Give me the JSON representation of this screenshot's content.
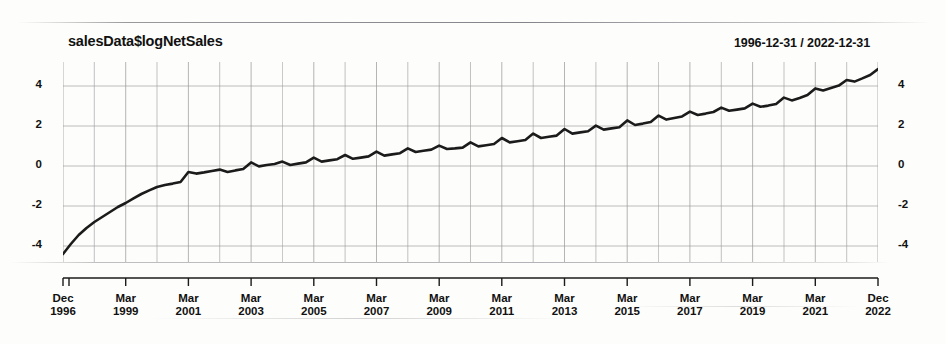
{
  "chart_data": {
    "type": "line",
    "title": "salesData$logNetSales",
    "subtitle": "1996-12-31 / 2022-12-31",
    "xlabel": "",
    "ylabel": "",
    "ylim": [
      -4.8,
      5.2
    ],
    "yticks": [
      4,
      2,
      0,
      -2,
      -4
    ],
    "ytick_labels_left": [
      "4",
      "2",
      "0",
      "-2",
      "-4"
    ],
    "ytick_labels_right": [
      "4",
      "2",
      "0",
      "-2",
      "-4"
    ],
    "xtick_labels": [
      {
        "month": "Dec",
        "year": "1996"
      },
      {
        "month": "Mar",
        "year": "1999"
      },
      {
        "month": "Mar",
        "year": "2001"
      },
      {
        "month": "Mar",
        "year": "2003"
      },
      {
        "month": "Mar",
        "year": "2005"
      },
      {
        "month": "Mar",
        "year": "2007"
      },
      {
        "month": "Mar",
        "year": "2009"
      },
      {
        "month": "Mar",
        "year": "2011"
      },
      {
        "month": "Mar",
        "year": "2013"
      },
      {
        "month": "Mar",
        "year": "2015"
      },
      {
        "month": "Mar",
        "year": "2017"
      },
      {
        "month": "Mar",
        "year": "2019"
      },
      {
        "month": "Mar",
        "year": "2021"
      },
      {
        "month": "Dec",
        "year": "2022"
      }
    ],
    "grid": true,
    "legend": "none",
    "line_color": "#1b1b1b",
    "grid_color": "#9a9a9a",
    "series": [
      {
        "name": "salesData$logNetSales",
        "x": [
          "1996-12",
          "1997-03",
          "1997-06",
          "1997-09",
          "1997-12",
          "1998-03",
          "1998-06",
          "1998-09",
          "1998-12",
          "1999-03",
          "1999-06",
          "1999-09",
          "1999-12",
          "2000-03",
          "2000-06",
          "2000-09",
          "2000-12",
          "2001-03",
          "2001-06",
          "2001-09",
          "2001-12",
          "2002-03",
          "2002-06",
          "2002-09",
          "2002-12",
          "2003-03",
          "2003-06",
          "2003-09",
          "2003-12",
          "2004-03",
          "2004-06",
          "2004-09",
          "2004-12",
          "2005-03",
          "2005-06",
          "2005-09",
          "2005-12",
          "2006-03",
          "2006-06",
          "2006-09",
          "2006-12",
          "2007-03",
          "2007-06",
          "2007-09",
          "2007-12",
          "2008-03",
          "2008-06",
          "2008-09",
          "2008-12",
          "2009-03",
          "2009-06",
          "2009-09",
          "2009-12",
          "2010-03",
          "2010-06",
          "2010-09",
          "2010-12",
          "2011-03",
          "2011-06",
          "2011-09",
          "2011-12",
          "2012-03",
          "2012-06",
          "2012-09",
          "2012-12",
          "2013-03",
          "2013-06",
          "2013-09",
          "2013-12",
          "2014-03",
          "2014-06",
          "2014-09",
          "2014-12",
          "2015-03",
          "2015-06",
          "2015-09",
          "2015-12",
          "2016-03",
          "2016-06",
          "2016-09",
          "2016-12",
          "2017-03",
          "2017-06",
          "2017-09",
          "2017-12",
          "2018-03",
          "2018-06",
          "2018-09",
          "2018-12",
          "2019-03",
          "2019-06",
          "2019-09",
          "2019-12",
          "2020-03",
          "2020-06",
          "2020-09",
          "2020-12",
          "2021-03",
          "2021-06",
          "2021-09",
          "2021-12",
          "2022-03",
          "2022-06",
          "2022-09",
          "2022-12"
        ],
        "values": [
          -4.4,
          -3.9,
          -3.45,
          -3.1,
          -2.8,
          -2.55,
          -2.3,
          -2.05,
          -1.85,
          -1.62,
          -1.4,
          -1.22,
          -1.05,
          -0.95,
          -0.88,
          -0.8,
          -0.3,
          -0.38,
          -0.32,
          -0.25,
          -0.18,
          -0.3,
          -0.22,
          -0.15,
          0.18,
          -0.02,
          0.05,
          0.1,
          0.22,
          0.05,
          0.12,
          0.18,
          0.42,
          0.22,
          0.28,
          0.34,
          0.55,
          0.36,
          0.42,
          0.48,
          0.72,
          0.52,
          0.58,
          0.64,
          0.88,
          0.7,
          0.76,
          0.82,
          1.02,
          0.85,
          0.88,
          0.92,
          1.18,
          0.98,
          1.04,
          1.1,
          1.4,
          1.18,
          1.24,
          1.3,
          1.62,
          1.4,
          1.46,
          1.52,
          1.85,
          1.62,
          1.68,
          1.74,
          2.02,
          1.82,
          1.88,
          1.94,
          2.28,
          2.05,
          2.12,
          2.2,
          2.52,
          2.32,
          2.4,
          2.48,
          2.72,
          2.55,
          2.62,
          2.7,
          2.92,
          2.76,
          2.82,
          2.88,
          3.12,
          2.96,
          3.02,
          3.1,
          3.42,
          3.28,
          3.4,
          3.55,
          3.88,
          3.78,
          3.9,
          4.02,
          4.3,
          4.22,
          4.38,
          4.55,
          4.85
        ]
      }
    ],
    "annotations": [
      "Steep initial rise from -4.4 (Dec 1996) through about -1.0 (Dec 1999)",
      "Annual seasonal sawtooth with Q4 peaks thereafter",
      "Series ends near 4.85 at Dec 2022"
    ]
  }
}
